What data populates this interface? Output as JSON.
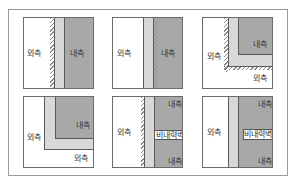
{
  "labels": {
    "outside": "외측",
    "inside": "내측",
    "non_bearing": "비내력벽"
  },
  "colors": {
    "light_layer": "#d8d8d8",
    "dark_layer": "#a8a8a8",
    "border": "#5a5a5a"
  },
  "panels": [
    {
      "id": 1,
      "type": "straight-wall-exterior-insulation"
    },
    {
      "id": 2,
      "type": "straight-wall-interior-hatch"
    },
    {
      "id": 3,
      "type": "corner-wall"
    },
    {
      "id": 4,
      "type": "corner-wall-inner"
    },
    {
      "id": 5,
      "type": "wall-with-non-bearing-section"
    },
    {
      "id": 6,
      "type": "wall-with-non-bearing-box"
    }
  ]
}
